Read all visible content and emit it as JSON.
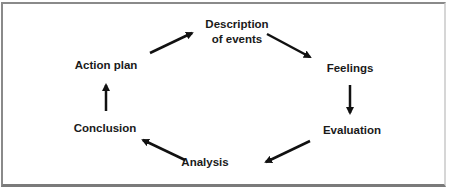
{
  "diagram": {
    "type": "cycle",
    "title": "",
    "nodes": [
      {
        "id": "description",
        "line1": "Description",
        "line2": "of events"
      },
      {
        "id": "feelings",
        "label": "Feelings"
      },
      {
        "id": "evaluation",
        "label": "Evaluation"
      },
      {
        "id": "analysis",
        "label": "Analysis"
      },
      {
        "id": "conclusion",
        "label": "Conclusion"
      },
      {
        "id": "action_plan",
        "label": "Action plan"
      }
    ],
    "edges": [
      {
        "from": "description",
        "to": "feelings"
      },
      {
        "from": "feelings",
        "to": "evaluation"
      },
      {
        "from": "evaluation",
        "to": "analysis"
      },
      {
        "from": "analysis",
        "to": "conclusion"
      },
      {
        "from": "conclusion",
        "to": "action_plan"
      },
      {
        "from": "action_plan",
        "to": "description"
      }
    ],
    "colors": {
      "text": "#1a1a1a",
      "arrow": "#111111",
      "border": "#8a8a8a",
      "background": "#ffffff"
    }
  }
}
